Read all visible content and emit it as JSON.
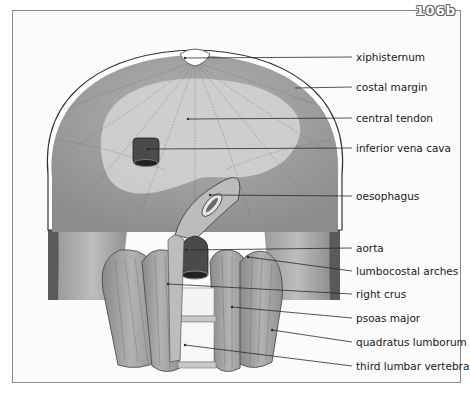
{
  "figure": {
    "number": "106b",
    "labels": [
      {
        "id": "xiphisternum",
        "text": "xiphisternum",
        "y": 51,
        "tx": 185,
        "ty": 58
      },
      {
        "id": "costal-margin",
        "text": "costal margin",
        "y": 81,
        "tx": 295,
        "ty": 88
      },
      {
        "id": "central-tendon",
        "text": "central tendon",
        "y": 112,
        "tx": 188,
        "ty": 119
      },
      {
        "id": "inferior-vena-cava",
        "text": "inferior vena cava",
        "y": 142,
        "tx": 148,
        "ty": 149
      },
      {
        "id": "oesophagus",
        "text": "oesophagus",
        "y": 190,
        "tx": 210,
        "ty": 195
      },
      {
        "id": "aorta",
        "text": "aorta",
        "y": 242,
        "tx": 186,
        "ty": 250
      },
      {
        "id": "lumbocostal-arches",
        "text": "lumbocostal arches",
        "y": 265,
        "tx": 248,
        "ty": 257
      },
      {
        "id": "right-crus",
        "text": "right crus",
        "y": 288,
        "tx": 168,
        "ty": 284
      },
      {
        "id": "psoas-major",
        "text": "psoas major",
        "y": 312,
        "tx": 232,
        "ty": 307
      },
      {
        "id": "quadratus-lumborum",
        "text": "quadratus lumborum",
        "y": 336,
        "tx": 272,
        "ty": 330
      },
      {
        "id": "third-lumbar-vertebra",
        "text": "third lumbar vertebra",
        "y": 360,
        "tx": 185,
        "ty": 345
      }
    ]
  },
  "colors": {
    "muscle_dark": "#8e8e8e",
    "muscle_mid": "#a8a8a8",
    "tendon_light": "#cfcfcf",
    "vessel_dark": "#4a4a4a",
    "bone_white": "#f4f4f4",
    "line": "#2a2a2a"
  }
}
